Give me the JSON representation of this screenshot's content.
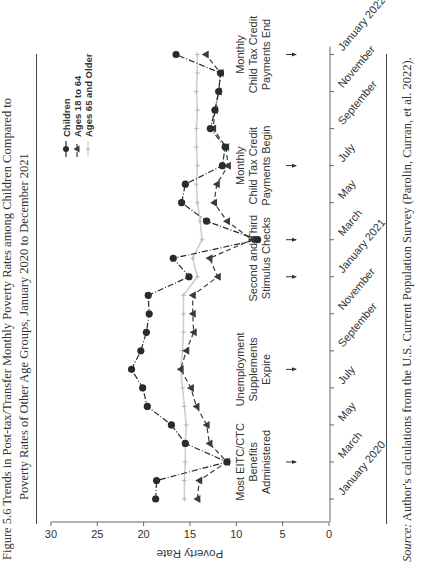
{
  "figure": {
    "label": "Figure 5.6",
    "title_line1": "Figure 5.6   Trends in Post-tax/Transfer Monthly Poverty Rates among Children Compared to",
    "title_line2": "Poverty Rates of Other Age Groups, January 2020 to December 2021",
    "source_label": "Source:",
    "source_text": " Author's calculations from the U.S. Current Population Survey (Parolin, Curran, et al. 2022)."
  },
  "chart_data": {
    "type": "line",
    "title": "Trends in Post-tax/Transfer Monthly Poverty Rates among Children Compared to Poverty Rates of Other Age Groups, January 2020 to December 2021",
    "xlabel": "",
    "ylabel": "Poverty Rate",
    "ylim": [
      0,
      30
    ],
    "yticks": [
      0,
      5,
      10,
      15,
      20,
      25,
      30
    ],
    "grid": false,
    "legend_position": "upper right",
    "x": [
      "Jan 2020",
      "Feb 2020",
      "Mar 2020",
      "Apr 2020",
      "May 2020",
      "Jun 2020",
      "Jul 2020",
      "Aug 2020",
      "Sep 2020",
      "Oct 2020",
      "Nov 2020",
      "Dec 2020",
      "Jan 2021",
      "Feb 2021",
      "Mar 2021",
      "Apr 2021",
      "May 2021",
      "Jun 2021",
      "Jul 2021",
      "Aug 2021",
      "Sep 2021",
      "Oct 2021",
      "Nov 2021",
      "Dec 2021",
      "Jan 2022"
    ],
    "xtick_labels": [
      "January 2020",
      "March",
      "May",
      "July",
      "September",
      "November",
      "January 2021",
      "March",
      "May",
      "July",
      "September",
      "November",
      "January 2022"
    ],
    "series": [
      {
        "name": "Children",
        "marker": "circle",
        "line": "dash-dot",
        "color": "#2b2b2b",
        "values": [
          18.7,
          18.6,
          11.0,
          15.5,
          17.0,
          19.6,
          20.1,
          21.3,
          20.3,
          19.7,
          19.4,
          19.5,
          15.1,
          16.8,
          7.7,
          13.2,
          15.9,
          15.5,
          11.5,
          11.2,
          12.8,
          12.3,
          11.9,
          11.7,
          16.5
        ]
      },
      {
        "name": "Ages 18 to 64",
        "marker": "triangle",
        "line": "dashed",
        "color": "#3a3a3a",
        "values": [
          14.2,
          14.0,
          11.0,
          12.9,
          13.2,
          14.3,
          14.9,
          16.0,
          15.4,
          14.6,
          14.7,
          14.7,
          12.0,
          12.9,
          8.3,
          11.0,
          12.4,
          12.1,
          10.9,
          11.1,
          12.5,
          12.3,
          11.9,
          11.7,
          13.3
        ]
      },
      {
        "name": "Ages 65 and Older",
        "marker": "plus",
        "line": "solid",
        "color": "#cfcfcf",
        "values": [
          15.6,
          15.6,
          15.5,
          15.5,
          15.4,
          15.6,
          15.8,
          16.0,
          15.8,
          15.7,
          15.7,
          15.7,
          14.2,
          14.7,
          13.7,
          13.9,
          14.2,
          14.3,
          14.2,
          14.3,
          14.3,
          14.2,
          14.3,
          14.2,
          14.2
        ]
      }
    ],
    "annotations": [
      {
        "lines": [
          "Most EITC/CTC",
          "Benefits",
          "Administered"
        ],
        "at": [
          "Mar 2020"
        ]
      },
      {
        "lines": [
          "Unemployment",
          "Supplements",
          "Expire"
        ],
        "at": [
          "Aug 2020"
        ]
      },
      {
        "lines": [
          "Second and Third",
          "Stimulus Checks"
        ],
        "at": [
          "Jan 2021",
          "Mar 2021"
        ]
      },
      {
        "lines": [
          "Monthly",
          "Child Tax Credit",
          "Payments Begin"
        ],
        "at": [
          "Jul 2021"
        ]
      },
      {
        "lines": [
          "Monthly",
          "Child Tax Credit",
          "Payments End"
        ],
        "at": [
          "Jan 2022"
        ]
      }
    ]
  }
}
